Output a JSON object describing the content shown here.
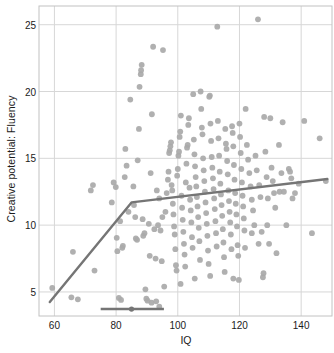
{
  "chart_data": {
    "type": "scatter",
    "title": "",
    "xlabel": "IQ",
    "ylabel": "Creative potential: Fluency",
    "xlim": [
      55,
      150
    ],
    "ylim": [
      3.2,
      26.4
    ],
    "xticks": [
      60,
      80,
      100,
      120,
      140
    ],
    "yticks": [
      5,
      10,
      15,
      20,
      25
    ],
    "grid": true,
    "legend": null,
    "marker_color": "#a9a9a9",
    "line_color": "#757575",
    "grid_color": "#d7d7d7",
    "frame_color": "#c2c2c2",
    "axis_text_color": "#1b1b1b",
    "annotations": [
      {
        "name": "segmented-regression-line",
        "type": "polyline",
        "points": [
          [
            58.5,
            4.25
          ],
          [
            85.0,
            11.7
          ],
          [
            148.5,
            13.45
          ]
        ],
        "breakpoint_x": 85.0
      },
      {
        "name": "breakpoint-confidence-interval",
        "type": "interval-bar",
        "y": 3.72,
        "x_low": 75.0,
        "x_center": 85.0,
        "x_high": 95.5
      }
    ],
    "points": [
      [
        59.3,
        5.3
      ],
      [
        65.5,
        4.6
      ],
      [
        67.6,
        4.45
      ],
      [
        66.0,
        8.0
      ],
      [
        71.8,
        12.6
      ],
      [
        73.0,
        6.6
      ],
      [
        79.2,
        13.2
      ],
      [
        78.6,
        11.7
      ],
      [
        79.9,
        12.85
      ],
      [
        80.2,
        9.05
      ],
      [
        80.4,
        8.05
      ],
      [
        80.9,
        4.55
      ],
      [
        81.3,
        10.3
      ],
      [
        81.6,
        4.4
      ],
      [
        82.0,
        8.3
      ],
      [
        82.2,
        8.45
      ],
      [
        82.8,
        13.6
      ],
      [
        83.4,
        14.45
      ],
      [
        83.0,
        15.7
      ],
      [
        84.6,
        19.4
      ],
      [
        85.6,
        12.9
      ],
      [
        85.8,
        11.5
      ],
      [
        86.2,
        10.6
      ],
      [
        86.4,
        9.0
      ],
      [
        86.8,
        8.9
      ],
      [
        87.0,
        14.85
      ],
      [
        87.4,
        17.2
      ],
      [
        87.6,
        20.35
      ],
      [
        88.0,
        21.3
      ],
      [
        88.1,
        21.6
      ],
      [
        88.3,
        22.0
      ],
      [
        88.6,
        10.45
      ],
      [
        88.8,
        9.2
      ],
      [
        89.2,
        9.4
      ],
      [
        89.5,
        5.2
      ],
      [
        89.8,
        4.5
      ],
      [
        90.2,
        4.35
      ],
      [
        90.6,
        10.1
      ],
      [
        90.9,
        7.7
      ],
      [
        91.2,
        13.9
      ],
      [
        91.6,
        18.3
      ],
      [
        92.0,
        23.35
      ],
      [
        92.4,
        9.7
      ],
      [
        92.8,
        7.5
      ],
      [
        93.0,
        4.3
      ],
      [
        93.6,
        10.0
      ],
      [
        94.0,
        12.0
      ],
      [
        94.4,
        9.6
      ],
      [
        94.8,
        7.3
      ],
      [
        95.2,
        23.1
      ],
      [
        95.6,
        5.4
      ],
      [
        96.0,
        11.0
      ],
      [
        96.4,
        12.4
      ],
      [
        96.8,
        13.4
      ],
      [
        97.0,
        14.0
      ],
      [
        97.2,
        15.4
      ],
      [
        97.4,
        15.6
      ],
      [
        97.6,
        15.9
      ],
      [
        97.8,
        16.2
      ],
      [
        98.0,
        13.0
      ],
      [
        98.2,
        12.6
      ],
      [
        98.4,
        11.6
      ],
      [
        98.6,
        10.8
      ],
      [
        98.8,
        9.9
      ],
      [
        99.0,
        9.3
      ],
      [
        99.2,
        8.2
      ],
      [
        99.4,
        7.0
      ],
      [
        99.6,
        6.6
      ],
      [
        99.8,
        13.7
      ],
      [
        100.0,
        14.2
      ],
      [
        100.2,
        15.2
      ],
      [
        100.4,
        15.5
      ],
      [
        100.6,
        16.6
      ],
      [
        100.8,
        17.0
      ],
      [
        101.0,
        18.2
      ],
      [
        101.2,
        12.2
      ],
      [
        101.4,
        11.3
      ],
      [
        101.6,
        10.4
      ],
      [
        101.8,
        9.5
      ],
      [
        102.0,
        8.6
      ],
      [
        102.2,
        7.8
      ],
      [
        102.4,
        6.9
      ],
      [
        102.6,
        13.2
      ],
      [
        102.8,
        14.6
      ],
      [
        103.0,
        15.8
      ],
      [
        103.2,
        16.0
      ],
      [
        103.4,
        17.5
      ],
      [
        103.6,
        18.0
      ],
      [
        103.8,
        12.8
      ],
      [
        104.0,
        11.9
      ],
      [
        104.2,
        11.1
      ],
      [
        104.4,
        10.2
      ],
      [
        104.6,
        9.1
      ],
      [
        104.8,
        8.3
      ],
      [
        105.0,
        19.8
      ],
      [
        105.2,
        16.4
      ],
      [
        105.4,
        15.3
      ],
      [
        105.6,
        14.4
      ],
      [
        105.8,
        13.6
      ],
      [
        106.0,
        12.9
      ],
      [
        106.2,
        12.1
      ],
      [
        106.4,
        11.4
      ],
      [
        106.6,
        10.6
      ],
      [
        106.8,
        9.8
      ],
      [
        107.0,
        8.8
      ],
      [
        107.2,
        7.4
      ],
      [
        107.4,
        20.0
      ],
      [
        107.6,
        18.7
      ],
      [
        107.8,
        17.3
      ],
      [
        108.0,
        16.8
      ],
      [
        108.2,
        15.0
      ],
      [
        108.4,
        14.1
      ],
      [
        108.6,
        13.3
      ],
      [
        108.8,
        12.5
      ],
      [
        109.0,
        11.7
      ],
      [
        109.2,
        10.9
      ],
      [
        109.4,
        10.1
      ],
      [
        109.6,
        9.2
      ],
      [
        109.8,
        8.1
      ],
      [
        110.0,
        7.1
      ],
      [
        110.2,
        19.6
      ],
      [
        110.4,
        19.7
      ],
      [
        110.6,
        17.6
      ],
      [
        110.8,
        16.3
      ],
      [
        111.0,
        15.1
      ],
      [
        111.2,
        14.3
      ],
      [
        111.4,
        13.5
      ],
      [
        111.6,
        12.7
      ],
      [
        111.8,
        12.0
      ],
      [
        112.0,
        11.2
      ],
      [
        112.2,
        10.3
      ],
      [
        112.4,
        9.4
      ],
      [
        112.6,
        8.4
      ],
      [
        112.8,
        24.85
      ],
      [
        113.0,
        17.8
      ],
      [
        113.2,
        16.5
      ],
      [
        113.4,
        15.2
      ],
      [
        113.6,
        14.0
      ],
      [
        113.8,
        13.1
      ],
      [
        114.0,
        12.3
      ],
      [
        114.2,
        11.5
      ],
      [
        114.4,
        10.7
      ],
      [
        114.6,
        9.7
      ],
      [
        114.8,
        8.7
      ],
      [
        115.0,
        7.6
      ],
      [
        115.2,
        6.5
      ],
      [
        115.4,
        17.2
      ],
      [
        115.6,
        16.1
      ],
      [
        115.8,
        15.7
      ],
      [
        116.0,
        14.8
      ],
      [
        116.2,
        13.8
      ],
      [
        116.4,
        12.6
      ],
      [
        116.6,
        11.8
      ],
      [
        116.8,
        11.0
      ],
      [
        117.0,
        10.2
      ],
      [
        117.2,
        9.3
      ],
      [
        117.4,
        8.2
      ],
      [
        117.6,
        17.4
      ],
      [
        117.8,
        16.9
      ],
      [
        118.0,
        15.9
      ],
      [
        118.2,
        14.5
      ],
      [
        118.4,
        13.4
      ],
      [
        118.6,
        12.4
      ],
      [
        118.8,
        11.6
      ],
      [
        119.0,
        10.8
      ],
      [
        119.2,
        9.9
      ],
      [
        119.4,
        8.5
      ],
      [
        119.6,
        7.7
      ],
      [
        119.8,
        5.9
      ],
      [
        120.0,
        17.6
      ],
      [
        120.2,
        16.6
      ],
      [
        120.4,
        15.4
      ],
      [
        120.6,
        14.2
      ],
      [
        120.8,
        13.2
      ],
      [
        121.0,
        12.2
      ],
      [
        121.2,
        11.4
      ],
      [
        121.4,
        10.5
      ],
      [
        121.6,
        9.6
      ],
      [
        121.8,
        8.3
      ],
      [
        122.0,
        18.7
      ],
      [
        122.4,
        16.0
      ],
      [
        122.8,
        14.9
      ],
      [
        123.2,
        13.9
      ],
      [
        123.6,
        12.9
      ],
      [
        124.0,
        11.9
      ],
      [
        124.4,
        11.1
      ],
      [
        124.8,
        10.0
      ],
      [
        125.2,
        15.2
      ],
      [
        125.6,
        14.1
      ],
      [
        126.0,
        25.4
      ],
      [
        126.4,
        13.0
      ],
      [
        126.8,
        12.1
      ],
      [
        127.2,
        9.5
      ],
      [
        127.6,
        6.1
      ],
      [
        127.8,
        6.4
      ],
      [
        128.0,
        18.1
      ],
      [
        128.4,
        15.5
      ],
      [
        128.8,
        13.6
      ],
      [
        129.2,
        12.0
      ],
      [
        129.6,
        8.6
      ],
      [
        130.0,
        18.0
      ],
      [
        130.4,
        14.3
      ],
      [
        130.8,
        13.3
      ],
      [
        131.2,
        12.4
      ],
      [
        131.6,
        11.3
      ],
      [
        132.0,
        7.9
      ],
      [
        132.8,
        16.0
      ],
      [
        133.6,
        13.9
      ],
      [
        134.0,
        17.7
      ],
      [
        134.4,
        12.5
      ],
      [
        135.2,
        10.0
      ],
      [
        136.0,
        14.2
      ],
      [
        136.4,
        14.0
      ],
      [
        136.8,
        13.5
      ],
      [
        137.2,
        12.0
      ],
      [
        138.0,
        12.4
      ],
      [
        139.2,
        13.1
      ],
      [
        141.0,
        17.8
      ],
      [
        143.5,
        9.4
      ],
      [
        146.0,
        16.5
      ],
      [
        148.0,
        13.3
      ],
      [
        94.0,
        3.9
      ],
      [
        91.5,
        4.2
      ],
      [
        72.5,
        13.0
      ],
      [
        84.0,
        11.0
      ],
      [
        93.2,
        12.6
      ],
      [
        95.0,
        10.6
      ],
      [
        100.9,
        5.6
      ],
      [
        105.5,
        6.0
      ],
      [
        110.5,
        6.2
      ],
      [
        118.0,
        6.0
      ],
      [
        124.0,
        9.4
      ],
      [
        126.2,
        8.6
      ],
      [
        129.0,
        10.0
      ],
      [
        133.0,
        12.5
      ]
    ]
  }
}
